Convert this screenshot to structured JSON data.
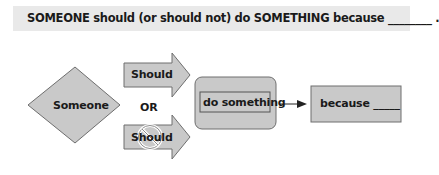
{
  "banner": {
    "text": "SOMEONE should (or should not) do SOMETHING because ________ ."
  },
  "diagram": {
    "subject": "Someone",
    "positive_arrow": "Should",
    "connector": "OR",
    "negative_arrow": "Should",
    "negative_marker": "prohibition-sign",
    "action_inner": "do something",
    "reason": "because _____",
    "colors": {
      "fill": "#c9c9c9",
      "stroke": "#6e6e6e",
      "banner": "#e9e9e9",
      "prohibition": "#ffffff"
    }
  }
}
